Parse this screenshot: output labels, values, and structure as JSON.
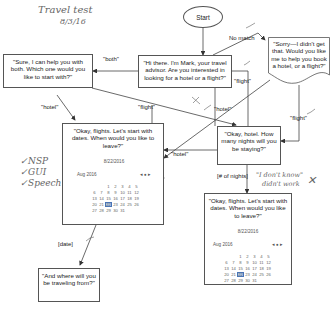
{
  "annotations": {
    "title": "Travel test",
    "date": "8/3/16",
    "checklist": [
      "✓NSP",
      "✓GUI",
      "✓Speech"
    ],
    "dont_know_note_line1": "\"I don't know\"",
    "dont_know_note_line2": "didn't work",
    "x_mark": "✕"
  },
  "nodes": {
    "start": "Start",
    "greeting": "\"Hi there.  I'm Mark, your travel advisor.  Are you interested in looking for a hotel or a flight?\"",
    "both": "\"Sure, I can help you with both. Which one would you like to start with?\"",
    "sorry": "\"Sorry—I didn't get that.  Would you like me to help you book a hotel, or a flight?\"",
    "flights_dates": "\"Okay, flights.  Let's start with dates.  When would you like to leave?\"",
    "hotel_nights": "\"Okay, hotel.  How many nights will you be staying?\"",
    "flights_dates_2": "\"Okay, flights.  Let's start with dates.  When would you like to leave?\"",
    "traveling_from": "\"And where will you be traveling from?\""
  },
  "edges": {
    "both": "\"both\"",
    "no_match": "No match",
    "flight_greeting": "\"flight\"",
    "hotel_from_both": "\"hotel\"",
    "flight_from_both": "\"flight\"",
    "hotel_from_greeting": "\"hotel\"",
    "hotel_from_flights": "\"hotel\"",
    "flight_from_sorry": "\"flight\"",
    "nights": "[# of nights]",
    "date": "[date]"
  },
  "calendar": {
    "selected_date": "8/22/2016",
    "month_label": "Aug 2016",
    "nav": "◂ ● ▸",
    "days": [
      "",
      "",
      "1",
      "2",
      "3",
      "4",
      "5",
      "6",
      "7",
      "8",
      "9",
      "10",
      "11",
      "12",
      "13",
      "14",
      "15",
      "16",
      "17",
      "18",
      "19",
      "20",
      "21",
      "22",
      "23",
      "24",
      "25",
      "26",
      "27",
      "28",
      "29",
      "30",
      "31"
    ],
    "selected_day": "22"
  },
  "colors": {
    "line": "#444444",
    "selection": "#aac4e6"
  }
}
